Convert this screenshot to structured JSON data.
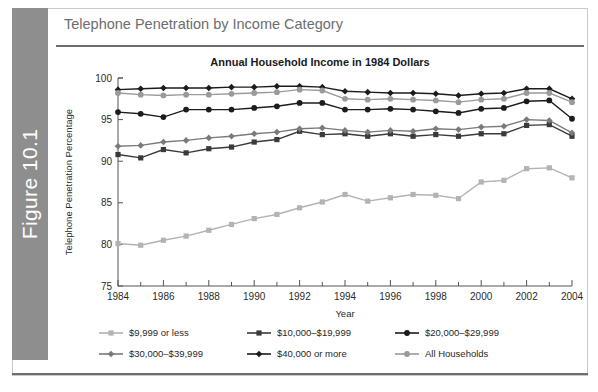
{
  "figure": {
    "tab_label": "Figure 10.1",
    "header_title": "Telephone Penetration by Income Category"
  },
  "chart_data": {
    "type": "line",
    "title": "Annual Household Income in 1984 Dollars",
    "xlabel": "Year",
    "ylabel": "Telephone Penetration Percentage",
    "xlim": [
      1984,
      2004
    ],
    "ylim": [
      75,
      100
    ],
    "yticks": [
      75,
      80,
      85,
      90,
      95,
      100
    ],
    "xticks_major": [
      1984,
      1986,
      1988,
      1990,
      1992,
      1994,
      1996,
      1998,
      2000,
      2002,
      2004
    ],
    "xticks_minor": [
      1985,
      1987,
      1989,
      1991,
      1993,
      1995,
      1997,
      1999,
      2001,
      2003
    ],
    "grid": false,
    "legend_position": "bottom",
    "x": [
      1984,
      1985,
      1986,
      1987,
      1988,
      1989,
      1990,
      1991,
      1992,
      1993,
      1994,
      1995,
      1996,
      1997,
      1998,
      1999,
      2000,
      2001,
      2002,
      2003,
      2004
    ],
    "series": [
      {
        "name": "$9,999 or less",
        "color": "#b3b3b3",
        "marker": "square",
        "values": [
          80.1,
          79.9,
          80.5,
          81.0,
          81.7,
          82.4,
          83.1,
          83.6,
          84.4,
          85.1,
          86.0,
          85.2,
          85.6,
          86.0,
          85.9,
          85.5,
          87.5,
          87.7,
          89.1,
          89.2,
          88.0
        ]
      },
      {
        "name": "$10,000–$19,999",
        "color": "#3a3a3a",
        "marker": "square",
        "values": [
          90.8,
          90.4,
          91.4,
          91.0,
          91.5,
          91.7,
          92.3,
          92.6,
          93.6,
          93.2,
          93.3,
          93.0,
          93.3,
          93.0,
          93.2,
          93.0,
          93.3,
          93.3,
          94.3,
          94.4,
          93.0
        ]
      },
      {
        "name": "$20,000–$29,999",
        "color": "#1c1c1c",
        "marker": "circle",
        "values": [
          95.9,
          95.7,
          95.3,
          96.2,
          96.2,
          96.2,
          96.4,
          96.6,
          97.0,
          97.0,
          96.2,
          96.2,
          96.3,
          96.2,
          96.0,
          95.8,
          96.3,
          96.4,
          97.2,
          97.3,
          95.1
        ]
      },
      {
        "name": "$30,000–$39,999",
        "color": "#7a7a7a",
        "marker": "diamond",
        "values": [
          91.8,
          91.9,
          92.3,
          92.5,
          92.8,
          93.0,
          93.3,
          93.5,
          93.9,
          94.0,
          93.7,
          93.5,
          93.7,
          93.6,
          93.9,
          93.8,
          94.1,
          94.2,
          95.0,
          94.9,
          93.4
        ]
      },
      {
        "name": "$40,000 or more",
        "color": "#1c1c1c",
        "marker": "diamond",
        "values": [
          98.6,
          98.7,
          98.8,
          98.8,
          98.8,
          98.9,
          98.9,
          99.0,
          99.0,
          98.9,
          98.4,
          98.3,
          98.2,
          98.2,
          98.1,
          97.9,
          98.1,
          98.2,
          98.7,
          98.7,
          97.5
        ]
      },
      {
        "name": "All Households",
        "color": "#9a9a9a",
        "marker": "circle",
        "values": [
          98.2,
          98.0,
          97.9,
          98.0,
          98.0,
          98.1,
          98.2,
          98.3,
          98.6,
          98.5,
          97.5,
          97.4,
          97.5,
          97.4,
          97.3,
          97.1,
          97.4,
          97.5,
          98.2,
          98.2,
          97.1
        ]
      }
    ]
  },
  "legend": {
    "rows": [
      [
        {
          "label": "$9,999 or less",
          "series_index": 0
        },
        {
          "label": "$10,000–$19,999",
          "series_index": 1
        },
        {
          "label": "$20,000–$29,999",
          "series_index": 2
        }
      ],
      [
        {
          "label": "$30,000–$39,999",
          "series_index": 3
        },
        {
          "label": "$40,000 or more",
          "series_index": 4
        },
        {
          "label": "All Households",
          "series_index": 5
        }
      ]
    ]
  }
}
